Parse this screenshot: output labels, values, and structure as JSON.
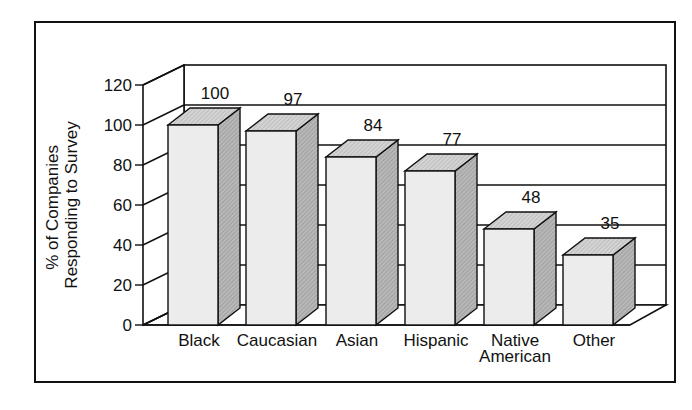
{
  "chart_data": {
    "type": "bar",
    "title": "",
    "xlabel": "",
    "ylabel": "% of Companies Responding to Survey",
    "ylabel_lines": [
      "% of Companies",
      "Responding to Survey"
    ],
    "categories": [
      "Black",
      "Caucasian",
      "Asian",
      "Hispanic",
      "Native American",
      "Other"
    ],
    "category_label_lines": [
      [
        "Black"
      ],
      [
        "Caucasian"
      ],
      [
        "Asian"
      ],
      [
        "Hispanic"
      ],
      [
        "Native",
        "American"
      ],
      [
        "Other"
      ]
    ],
    "values": [
      100,
      97,
      84,
      77,
      48,
      35
    ],
    "data_labels": [
      "100",
      "97",
      "84",
      "77",
      "48",
      "35"
    ],
    "yticks": [
      0,
      20,
      40,
      60,
      80,
      100,
      120
    ],
    "ylim": [
      0,
      120
    ],
    "grid": true,
    "legend": "none",
    "style": "3d-bar",
    "colors": {
      "front": "#ececec",
      "side": "#b8b8b8",
      "top": "#d4d4d4",
      "line": "#111111"
    }
  }
}
